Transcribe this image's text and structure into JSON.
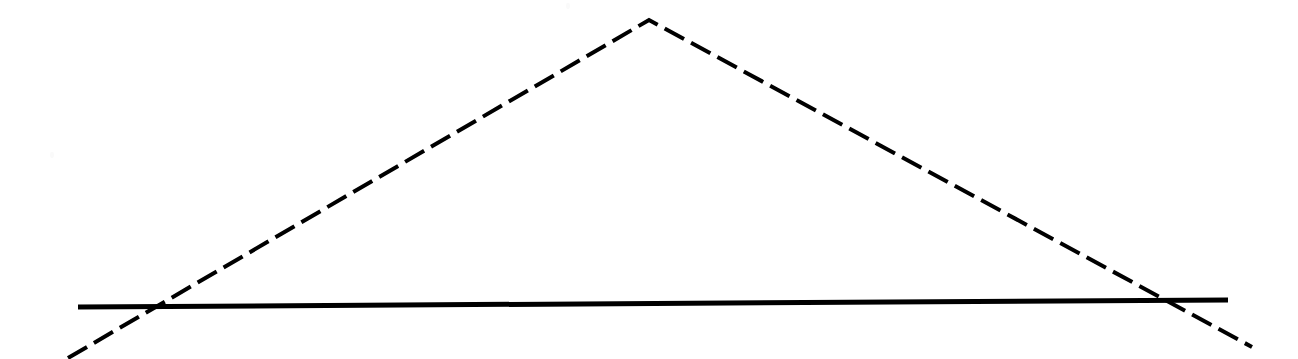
{
  "figure": {
    "title": "",
    "background_color": "#ffffff",
    "width": 1298,
    "height": 359,
    "stroke_color": "#000000"
  },
  "chart_data": {
    "type": "line",
    "title": "",
    "subtitle": "",
    "xlabel": "",
    "ylabel": "",
    "grid": false,
    "legend_position": "none",
    "axis_visible": false,
    "tick_labels_x": [],
    "tick_labels_y": [],
    "xlim": [
      0,
      1298
    ],
    "ylim": [
      359,
      0
    ],
    "coordinate_note": "Values are pixel coordinates in image space; y increases downward.",
    "series": [
      {
        "name": "solid-line",
        "style": "solid",
        "color": "#000000",
        "line_width": 5,
        "points": [
          {
            "x": 78,
            "y": 307
          },
          {
            "x": 1228,
            "y": 300
          }
        ]
      },
      {
        "name": "dashed-tent-line",
        "style": "dashed",
        "color": "#000000",
        "line_width": 4,
        "dash_length": 22,
        "gap_length": 8,
        "points": [
          {
            "x": 68,
            "y": 358
          },
          {
            "x": 649,
            "y": 20
          },
          {
            "x": 1252,
            "y": 347
          }
        ]
      }
    ],
    "annotations": [
      {
        "name": "apex",
        "x": 649,
        "y": 20,
        "label": ""
      },
      {
        "name": "left-intersection",
        "x": 148,
        "y": 306,
        "label": ""
      },
      {
        "name": "right-intersection",
        "x": 1158,
        "y": 301,
        "label": ""
      }
    ]
  }
}
